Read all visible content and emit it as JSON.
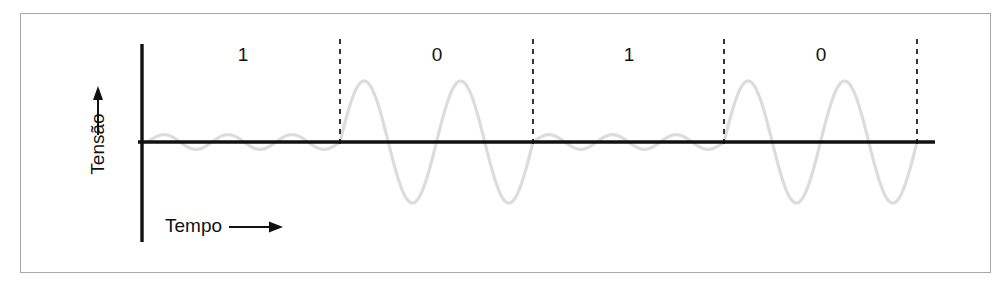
{
  "figure": {
    "axes": {
      "y_label": "Tensão",
      "x_label": "Tempo",
      "y_arrow_icon": "up-arrow-icon",
      "x_arrow_icon": "right-arrow-icon"
    },
    "colors": {
      "frame": "#a9a9a9",
      "axis": "#111111",
      "waveform": "#dcdcdc",
      "divider": "#111111",
      "background": "#ffffff",
      "text": "#111111"
    }
  },
  "chart_data": {
    "type": "line",
    "title": "",
    "xlabel": "Tempo",
    "ylabel": "Tensão",
    "grid": false,
    "legend": null,
    "bit_labels": [
      "1",
      "0",
      "1",
      "0"
    ],
    "bit_sequence": [
      1,
      0,
      1,
      0
    ],
    "segments": [
      {
        "bit": "1",
        "amplitude": 0.12,
        "cycles": 3,
        "x_start": 148,
        "x_end": 340,
        "label_x": 243
      },
      {
        "bit": "0",
        "amplitude": 1.0,
        "cycles": 2,
        "x_start": 340,
        "x_end": 533,
        "label_x": 437
      },
      {
        "bit": "1",
        "amplitude": 0.12,
        "cycles": 3,
        "x_start": 533,
        "x_end": 724,
        "label_x": 629
      },
      {
        "bit": "0",
        "amplitude": 1.0,
        "cycles": 2,
        "x_start": 724,
        "x_end": 917,
        "label_x": 821
      }
    ],
    "dividers_x": [
      340,
      533,
      724,
      917
    ],
    "baseline_y": 142,
    "axis_x": 142,
    "axis_y_top": 44,
    "axis_y_bottom": 242,
    "baseline_x_end": 935,
    "peak_amplitude_px": 61,
    "label_y": 45,
    "axis_ranges": {
      "x": [
        148,
        935
      ],
      "y": [
        -1.1,
        1.1
      ]
    }
  }
}
